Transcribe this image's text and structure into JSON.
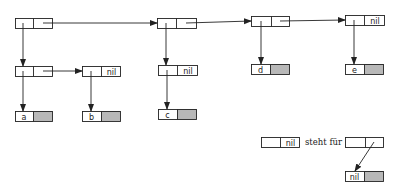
{
  "diagram": {
    "type": "linked-list-structure",
    "colors": {
      "line": "#222222",
      "shaded": "#b8b8b8",
      "background": "#ffffff"
    },
    "nodes": [
      {
        "id": "n1",
        "x": 15,
        "y": 18,
        "w": 37,
        "h": 10,
        "div": 33,
        "left": "",
        "right": "",
        "shaded": false
      },
      {
        "id": "n2",
        "x": 157,
        "y": 18,
        "w": 39,
        "h": 10,
        "div": 176,
        "left": "",
        "right": "",
        "shaded": false
      },
      {
        "id": "n3",
        "x": 251,
        "y": 16,
        "w": 38,
        "h": 10,
        "div": 271,
        "left": "",
        "right": "",
        "shaded": false
      },
      {
        "id": "n4",
        "x": 345,
        "y": 15,
        "w": 39,
        "h": 10,
        "div": 364,
        "left": "",
        "right": "nil",
        "shaded": false
      },
      {
        "id": "n5",
        "x": 15,
        "y": 66,
        "w": 37,
        "h": 10,
        "div": 33,
        "left": "",
        "right": "",
        "shaded": false
      },
      {
        "id": "n6",
        "x": 82,
        "y": 66,
        "w": 38,
        "h": 10,
        "div": 101,
        "left": "",
        "right": "nil",
        "shaded": false
      },
      {
        "id": "n7",
        "x": 158,
        "y": 65,
        "w": 39,
        "h": 10,
        "div": 177,
        "left": "",
        "right": "nil",
        "shaded": false
      },
      {
        "id": "d",
        "x": 251,
        "y": 64,
        "w": 38,
        "h": 10,
        "div": 270,
        "left": "d",
        "right": "",
        "shaded": true
      },
      {
        "id": "e",
        "x": 345,
        "y": 64,
        "w": 38,
        "h": 10,
        "div": 364,
        "left": "e",
        "right": "",
        "shaded": true
      },
      {
        "id": "a",
        "x": 15,
        "y": 111,
        "w": 37,
        "h": 10,
        "div": 33,
        "left": "a",
        "right": "",
        "shaded": true
      },
      {
        "id": "b",
        "x": 82,
        "y": 111,
        "w": 38,
        "h": 10,
        "div": 101,
        "left": "b",
        "right": "",
        "shaded": true
      },
      {
        "id": "c",
        "x": 158,
        "y": 109,
        "w": 38,
        "h": 10,
        "div": 177,
        "left": "c",
        "right": "",
        "shaded": true
      },
      {
        "id": "leg1",
        "x": 261,
        "y": 137,
        "w": 38,
        "h": 10,
        "div": 280,
        "left": "",
        "right": "nil",
        "shaded": false
      },
      {
        "id": "leg2",
        "x": 345,
        "y": 137,
        "w": 38,
        "h": 10,
        "div": 365,
        "left": "",
        "right": "",
        "shaded": false
      },
      {
        "id": "leg3",
        "x": 345,
        "y": 171,
        "w": 38,
        "h": 10,
        "div": 364,
        "left": "nil",
        "right": "",
        "shaded": true
      }
    ],
    "arrows": [
      {
        "from": [
          43,
          23
        ],
        "to": [
          157,
          23
        ]
      },
      {
        "from": [
          186,
          23
        ],
        "to": [
          251,
          21
        ]
      },
      {
        "from": [
          280,
          21
        ],
        "to": [
          345,
          20
        ]
      },
      {
        "from": [
          23,
          23
        ],
        "to": [
          23,
          66
        ]
      },
      {
        "from": [
          166,
          23
        ],
        "to": [
          166,
          65
        ]
      },
      {
        "from": [
          261,
          21
        ],
        "to": [
          261,
          64
        ]
      },
      {
        "from": [
          354,
          20
        ],
        "to": [
          354,
          64
        ]
      },
      {
        "from": [
          43,
          71
        ],
        "to": [
          82,
          71
        ]
      },
      {
        "from": [
          23,
          71
        ],
        "to": [
          23,
          111
        ]
      },
      {
        "from": [
          91,
          71
        ],
        "to": [
          91,
          111
        ]
      },
      {
        "from": [
          167,
          70
        ],
        "to": [
          167,
          109
        ]
      },
      {
        "from": [
          374,
          142
        ],
        "to": [
          355,
          171
        ]
      }
    ],
    "legend": {
      "text": "steht für",
      "x": 305,
      "y": 145
    }
  }
}
